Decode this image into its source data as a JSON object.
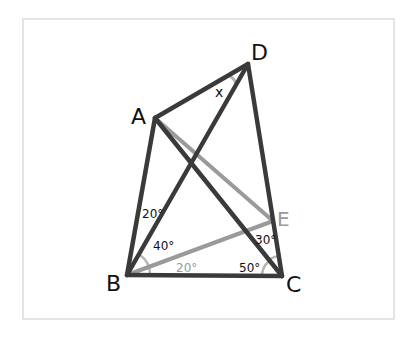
{
  "diagram": {
    "frame": {
      "x": 23,
      "y": 19,
      "width": 371,
      "height": 300,
      "stroke": "#e4e4e4"
    },
    "colors": {
      "dark": "#3a3a3a",
      "gray": "#9a9a9a",
      "text": "#111111"
    },
    "points": {
      "A": {
        "label": "A",
        "x": 155,
        "y": 118
      },
      "B": {
        "label": "B",
        "x": 127,
        "y": 275
      },
      "C": {
        "label": "C",
        "x": 282,
        "y": 276
      },
      "D": {
        "label": "D",
        "x": 248,
        "y": 64
      },
      "E": {
        "label": "E",
        "x": 273,
        "y": 221
      }
    },
    "segments_dark": [
      "AB",
      "AD",
      "DC",
      "BC",
      "BD",
      "AC"
    ],
    "segments_gray": [
      "AE",
      "BE"
    ],
    "angle_labels": {
      "x_at_D": "x",
      "ABD": "20°",
      "DBE": "40°",
      "EBC": "20°",
      "BCA": "50°",
      "ACD": "30°"
    }
  }
}
